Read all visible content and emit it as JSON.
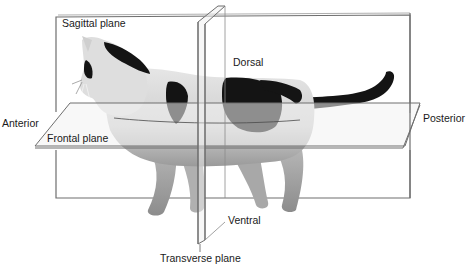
{
  "diagram": {
    "labels": {
      "sagittal_plane": "Sagittal plane",
      "dorsal": "Dorsal",
      "anterior": "Anterior",
      "posterior": "Posterior",
      "frontal_plane": "Frontal plane",
      "ventral": "Ventral",
      "transverse_plane": "Transverse plane"
    },
    "colors": {
      "plane_line": "#6e6e6e",
      "plane_fill": "#e8e8e8",
      "cat_white": "#d9d9d9",
      "cat_black": "#141414",
      "background": "#ffffff"
    }
  }
}
